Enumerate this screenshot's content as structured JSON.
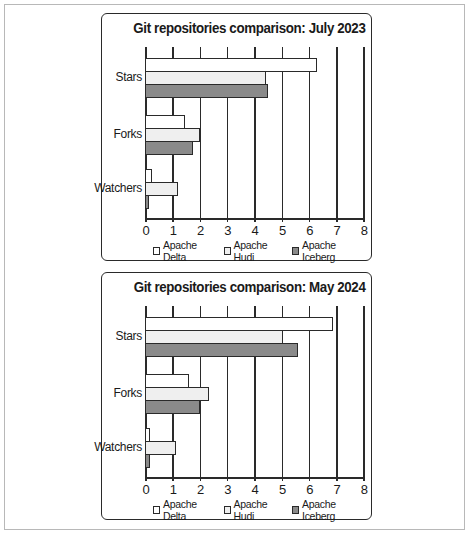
{
  "chart_data": [
    {
      "type": "bar",
      "orientation": "horizontal",
      "title": "Git repositories comparison: July 2023",
      "categories": [
        "Stars",
        "Forks",
        "Watchers"
      ],
      "series": [
        {
          "name": "Apache Delta",
          "values": [
            6.3,
            1.45,
            0.25
          ],
          "color": "#ffffff"
        },
        {
          "name": "Apache Hudi",
          "values": [
            4.45,
            2.0,
            1.2
          ],
          "color": "#efefef"
        },
        {
          "name": "Apache Iceberg",
          "values": [
            4.5,
            1.75,
            0.15
          ],
          "color": "#8a8a8a"
        }
      ],
      "xlabel": "",
      "ylabel": "",
      "xlim": [
        0,
        8
      ],
      "xticks": [
        "0",
        "1",
        "2",
        "3",
        "4",
        "5",
        "6",
        "7",
        "8"
      ],
      "grid": true,
      "legend_position": "bottom"
    },
    {
      "type": "bar",
      "orientation": "horizontal",
      "title": "Git repositories comparison: May 2024",
      "categories": [
        "Stars",
        "Forks",
        "Watchers"
      ],
      "series": [
        {
          "name": "Apache Delta",
          "values": [
            6.9,
            1.6,
            0.2
          ],
          "color": "#ffffff"
        },
        {
          "name": "Apache Hudi",
          "values": [
            5.05,
            2.35,
            1.15
          ],
          "color": "#efefef"
        },
        {
          "name": "Apache Iceberg",
          "values": [
            5.6,
            2.0,
            0.2
          ],
          "color": "#8a8a8a"
        }
      ],
      "xlabel": "",
      "ylabel": "",
      "xlim": [
        0,
        8
      ],
      "xticks": [
        "0",
        "1",
        "2",
        "3",
        "4",
        "5",
        "6",
        "7",
        "8"
      ],
      "grid": true,
      "legend_position": "bottom"
    }
  ]
}
